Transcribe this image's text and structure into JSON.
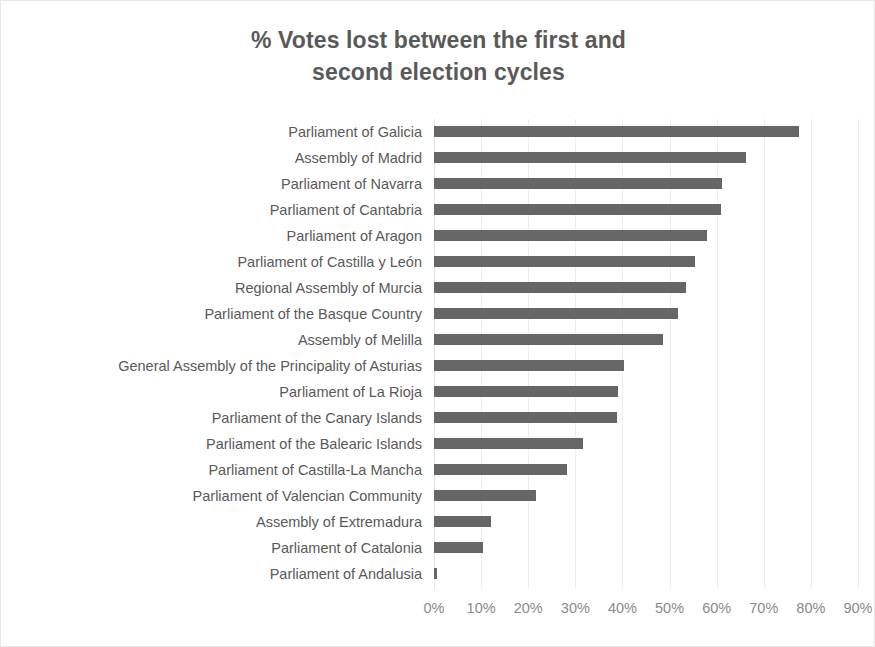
{
  "chart_data": {
    "type": "bar",
    "orientation": "horizontal",
    "title": "% Votes lost between the first and\nsecond election cycles",
    "title_line_1": "% Votes lost between the first and",
    "title_line_2": "second election cycles",
    "xlabel": "",
    "ylabel": "",
    "xlim": [
      0,
      90
    ],
    "grid": true,
    "legend": false,
    "bar_color": "#666666",
    "gridline_color": "#ededed",
    "label_color": "#595959",
    "tick_color": "#8a8a8a",
    "tick_labels": [
      "0%",
      "10%",
      "20%",
      "30%",
      "40%",
      "50%",
      "60%",
      "70%",
      "80%",
      "90%"
    ],
    "tick_values": [
      0,
      10,
      20,
      30,
      40,
      50,
      60,
      70,
      80,
      90
    ],
    "categories": [
      "Parliament of Galicia",
      "Assembly of Madrid",
      "Parliament of Navarra",
      "Parliament of Cantabria",
      "Parliament of Aragon",
      "Parliament of Castilla y León",
      "Regional Assembly of Murcia",
      "Parliament of the Basque Country",
      "Assembly of Melilla",
      "General Assembly of the Principality of Asturias",
      "Parliament of La Rioja",
      "Parliament of the Canary Islands",
      "Parliament of the Balearic Islands",
      "Parliament of Castilla-La Mancha",
      "Parliament of Valencian Community",
      "Assembly of Extremadura",
      "Parliament of Catalonia",
      "Parliament of Andalusia"
    ],
    "values": [
      77.5,
      66.3,
      61.1,
      61.0,
      58.0,
      55.3,
      53.4,
      51.7,
      48.7,
      40.4,
      39.0,
      38.9,
      31.7,
      28.3,
      21.7,
      12.0,
      10.4,
      0.7
    ]
  }
}
